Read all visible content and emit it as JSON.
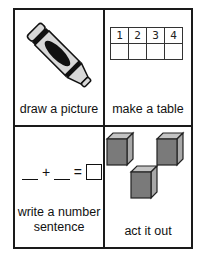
{
  "cells": [
    {
      "id": "draw-a-picture",
      "label": "draw a picture",
      "icon": "crayon-icon"
    },
    {
      "id": "make-a-table",
      "label": "make a table",
      "icon": "table-icon",
      "table": {
        "header": [
          "1",
          "2",
          "3",
          "4"
        ],
        "row": [
          "",
          "",
          "",
          ""
        ]
      }
    },
    {
      "id": "write-a-number-sentence",
      "label": "write a number sentence",
      "icon": "number-sentence-icon",
      "equation": {
        "plus": "+",
        "equals": "="
      }
    },
    {
      "id": "act-it-out",
      "label": "act it out",
      "icon": "cubes-icon"
    }
  ],
  "colors": {
    "border": "#1a1a1a",
    "cube_face": "#7a7a7a",
    "cube_side": "#a8a8a8",
    "cube_top": "#c4c4c4",
    "crayon_body": "#d8d8d8",
    "crayon_band": "#111111"
  }
}
